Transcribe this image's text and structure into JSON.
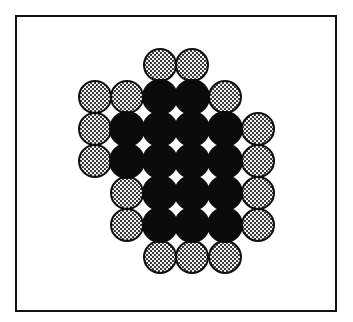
{
  "figure": {
    "frame": {
      "left": 15,
      "top": 15,
      "right": 337,
      "bottom": 311
    },
    "grid": {
      "col_x": [
        95,
        127,
        160,
        192,
        225,
        258
      ],
      "row_y": [
        65,
        97,
        129,
        161,
        193,
        225,
        257
      ],
      "radius": 17
    },
    "colors": {
      "core": "#0a0a0a",
      "shell_fill_light": "#f2f2f2",
      "shell_fill_dark": "#3a3a3a",
      "shell_stroke": "#111111",
      "frame": "#111111"
    },
    "legend_types": [
      "core",
      "shell"
    ],
    "layout": [
      [
        "",
        "",
        "shell",
        "shell",
        "",
        ""
      ],
      [
        "shell",
        "shell",
        "core",
        "core",
        "shell",
        ""
      ],
      [
        "shell",
        "core",
        "core",
        "core",
        "core",
        "shell"
      ],
      [
        "shell",
        "core",
        "core",
        "core",
        "core",
        "shell"
      ],
      [
        "",
        "shell",
        "core",
        "core",
        "core",
        "shell"
      ],
      [
        "",
        "shell",
        "core",
        "core",
        "core",
        "shell"
      ],
      [
        "",
        "",
        "shell",
        "shell",
        "shell",
        ""
      ]
    ],
    "counts": {
      "core": 16,
      "shell": 18
    }
  }
}
